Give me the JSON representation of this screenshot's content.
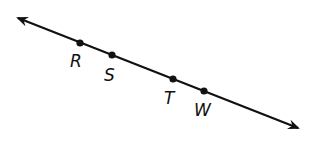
{
  "diagram": {
    "type": "line",
    "line": {
      "start": [
        18,
        18
      ],
      "end": [
        298,
        128
      ],
      "arrows": "both",
      "color": "#111111"
    },
    "points": [
      {
        "label": "R",
        "x": 80,
        "y": 43,
        "lx": 70,
        "ly": 67
      },
      {
        "label": "S",
        "x": 112,
        "y": 55,
        "lx": 104,
        "ly": 81
      },
      {
        "label": "T",
        "x": 173,
        "y": 79,
        "lx": 164,
        "ly": 104
      },
      {
        "label": "W",
        "x": 204,
        "y": 91,
        "lx": 194,
        "ly": 116
      }
    ]
  }
}
